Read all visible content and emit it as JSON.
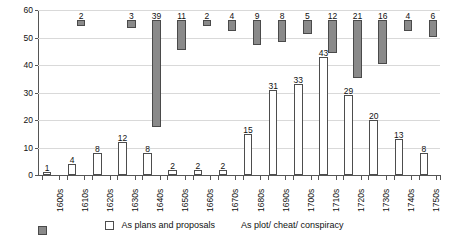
{
  "chart_data": {
    "type": "bar",
    "title": "",
    "xlabel": "",
    "ylabel": "Number of titles",
    "ylim": [
      0,
      60
    ],
    "ytick_step": 10,
    "yticks": [
      0,
      10,
      20,
      30,
      40,
      50,
      60
    ],
    "grid": true,
    "legend_position": "bottom",
    "categories": [
      "1600s",
      "1610s",
      "1620s",
      "1630s",
      "1640s",
      "1650s",
      "1660s",
      "1670s",
      "1680s",
      "1690s",
      "1700s",
      "1710s",
      "1720s",
      "1730s",
      "1740s",
      "1750s"
    ],
    "series": [
      {
        "name": "As plans and proposals",
        "color": "#ffffff",
        "values": [
          1,
          4,
          8,
          12,
          8,
          2,
          2,
          2,
          15,
          31,
          33,
          43,
          29,
          20,
          13,
          8
        ]
      },
      {
        "name": "As plot/ cheat/ conspiracy",
        "color": "#8a8a8a",
        "values": [
          0,
          2,
          0,
          3,
          39,
          11,
          2,
          4,
          9,
          8,
          5,
          12,
          21,
          16,
          4,
          6
        ]
      }
    ]
  },
  "legend": {
    "items": [
      {
        "label": "As plans and proposals",
        "swatch": "white-square-icon"
      },
      {
        "label": "As plot/ cheat/ conspiracy",
        "swatch": "gray-square-icon"
      }
    ]
  }
}
